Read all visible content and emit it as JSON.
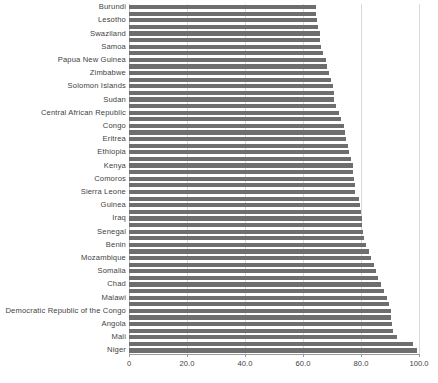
{
  "chart_data": {
    "type": "bar",
    "orientation": "horizontal",
    "title": "",
    "subtitle": "",
    "xlabel": "",
    "ylabel": "",
    "xlim": [
      0,
      100
    ],
    "grid": true,
    "legend": false,
    "legend_position": "none",
    "bar_color": "#6e6e6e",
    "gridline_color": "#d9d9d9",
    "axis_color": "#9a9a9a",
    "xticks": [
      "0",
      "20.0",
      "40.0",
      "60.0",
      "80.0",
      "100.0"
    ],
    "xtick_values": [
      0,
      20,
      40,
      60,
      80,
      100
    ],
    "label_interval": 2,
    "categories": [
      "Burundi",
      "",
      "Lesotho",
      "",
      "Swaziland",
      "",
      "Samoa",
      "",
      "Papua New Guinea",
      "",
      "Zimbabwe",
      "",
      "Solomon Islands",
      "",
      "Sudan",
      "",
      "Central African Republic",
      "",
      "Congo",
      "",
      "Eritrea",
      "",
      "Ethiopia",
      "",
      "Kenya",
      "",
      "Comoros",
      "",
      "Sierra Leone",
      "",
      "Guinea",
      "",
      "Iraq",
      "",
      "Senegal",
      "",
      "Benin",
      "",
      "Mozambique",
      "",
      "Somalia",
      "",
      "Chad",
      "",
      "Malawi",
      "",
      "Democratic Republic of the Congo",
      "",
      "Angola",
      "",
      "Mali",
      "",
      "Niger"
    ],
    "values": [
      64.5,
      64.5,
      64.8,
      65.2,
      65.7,
      66.0,
      66.3,
      67.0,
      68.0,
      68.4,
      68.8,
      69.6,
      70.2,
      70.6,
      70.6,
      71.5,
      72.5,
      73.2,
      74.0,
      74.4,
      74.8,
      75.5,
      76.0,
      76.6,
      77.2,
      77.4,
      77.6,
      77.8,
      78.0,
      79.2,
      79.5,
      80.0,
      80.2,
      80.4,
      80.6,
      81.2,
      81.6,
      82.8,
      83.4,
      84.6,
      85.0,
      85.8,
      86.8,
      88.0,
      89.0,
      89.8,
      90.2,
      90.4,
      90.6,
      91.2,
      92.4,
      97.8,
      99.3
    ]
  }
}
